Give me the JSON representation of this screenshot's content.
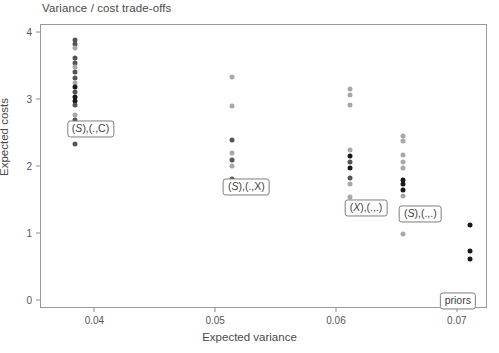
{
  "chart_data": {
    "type": "scatter",
    "title": "Variance / cost trade-offs",
    "xlabel": "Expected variance",
    "ylabel": "Expected costs",
    "xlim": [
      0.0355,
      0.0725
    ],
    "ylim": [
      -0.12,
      4.12
    ],
    "xticks": [
      0.04,
      0.05,
      0.06,
      0.07
    ],
    "xtick_labels": [
      "0.04",
      "0.05",
      "0.06",
      "0.07"
    ],
    "yticks": [
      0,
      1,
      2,
      3,
      4
    ],
    "ytick_labels": [
      "0",
      "1",
      "2",
      "3",
      "4"
    ],
    "grid": false,
    "legend": "none",
    "point_color_dark": "#1a1a1a",
    "point_color_mid": "#555555",
    "point_color_light": "#a8a8a8",
    "panel_border_color": "#9a9a9a",
    "groups": [
      {
        "name": "cluster-1",
        "x": 0.0383,
        "points": [
          {
            "y": 3.9,
            "shade": "mid"
          },
          {
            "y": 3.84,
            "shade": "mid"
          },
          {
            "y": 3.77,
            "shade": "light"
          },
          {
            "y": 3.62,
            "shade": "mid"
          },
          {
            "y": 3.55,
            "shade": "mid"
          },
          {
            "y": 3.49,
            "shade": "light"
          },
          {
            "y": 3.42,
            "shade": "mid"
          },
          {
            "y": 3.33,
            "shade": "mid"
          },
          {
            "y": 3.26,
            "shade": "light"
          },
          {
            "y": 3.19,
            "shade": "dark"
          },
          {
            "y": 3.12,
            "shade": "mid"
          },
          {
            "y": 3.05,
            "shade": "dark"
          },
          {
            "y": 2.99,
            "shade": "dark"
          },
          {
            "y": 2.92,
            "shade": "mid"
          },
          {
            "y": 2.78,
            "shade": "light"
          },
          {
            "y": 2.7,
            "shade": "mid"
          },
          {
            "y": 2.66,
            "shade": "dark"
          },
          {
            "y": 2.35,
            "shade": "mid"
          }
        ]
      },
      {
        "name": "cluster-2",
        "x": 0.0513,
        "points": [
          {
            "y": 3.34,
            "shade": "light"
          },
          {
            "y": 2.91,
            "shade": "light"
          },
          {
            "y": 2.4,
            "shade": "mid"
          },
          {
            "y": 2.21,
            "shade": "light"
          },
          {
            "y": 2.1,
            "shade": "mid"
          },
          {
            "y": 2.01,
            "shade": "light"
          },
          {
            "y": 1.82,
            "shade": "mid"
          }
        ]
      },
      {
        "name": "cluster-3",
        "x": 0.0611,
        "points": [
          {
            "y": 3.16,
            "shade": "light"
          },
          {
            "y": 3.08,
            "shade": "light"
          },
          {
            "y": 2.92,
            "shade": "light"
          },
          {
            "y": 2.26,
            "shade": "light"
          },
          {
            "y": 2.17,
            "shade": "dark"
          },
          {
            "y": 2.08,
            "shade": "mid"
          },
          {
            "y": 1.99,
            "shade": "dark"
          },
          {
            "y": 1.84,
            "shade": "mid"
          },
          {
            "y": 1.75,
            "shade": "light"
          },
          {
            "y": 1.55,
            "shade": "light"
          }
        ]
      },
      {
        "name": "cluster-4",
        "x": 0.0655,
        "points": [
          {
            "y": 2.46,
            "shade": "light"
          },
          {
            "y": 2.39,
            "shade": "light"
          },
          {
            "y": 2.18,
            "shade": "light"
          },
          {
            "y": 2.08,
            "shade": "light"
          },
          {
            "y": 1.99,
            "shade": "light"
          },
          {
            "y": 1.81,
            "shade": "dark"
          },
          {
            "y": 1.74,
            "shade": "dark"
          },
          {
            "y": 1.66,
            "shade": "dark"
          },
          {
            "y": 1.57,
            "shade": "light"
          },
          {
            "y": 1.0,
            "shade": "light"
          }
        ]
      },
      {
        "name": "outliers",
        "x": 0.071,
        "points": [
          {
            "y": 1.13,
            "shade": "dark"
          },
          {
            "y": 0.75,
            "shade": "dark"
          },
          {
            "y": 0.62,
            "shade": "dark"
          },
          {
            "y": 0.0,
            "shade": "light"
          }
        ]
      }
    ],
    "annotations": [
      {
        "name": "label-s-c",
        "text": "(S),(.,C)",
        "italic_head": "S",
        "x": 0.0396,
        "y": 2.565
      },
      {
        "name": "label-s-x",
        "text": "(S),(.,X)",
        "italic_head": "S",
        "x": 0.0525,
        "y": 1.695
      },
      {
        "name": "label-x-dotdot",
        "text": "(X),(.,.)",
        "italic_head": "X",
        "x": 0.0624,
        "y": 1.385
      },
      {
        "name": "label-s-dotdot",
        "text": "(S),(.,.)",
        "italic_head": "S",
        "x": 0.0669,
        "y": 1.3
      },
      {
        "name": "label-priors",
        "text": "priors",
        "italic_head": "",
        "x": 0.07,
        "y": 0.005
      }
    ]
  }
}
